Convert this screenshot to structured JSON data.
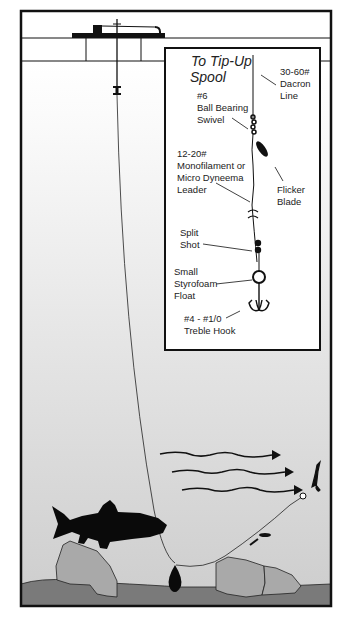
{
  "diagram": {
    "type": "ice-fishing tip-up rig illustration",
    "colors": {
      "frame": "#111111",
      "water_top": "#ffffff",
      "water_bottom": "#cfcfcf",
      "lake_bed": "#7a7a7a",
      "rock": "#a9a9a9",
      "silhouette": "#0a0a0a",
      "inset_bg": "#ffffff"
    },
    "scene": {
      "ice_layer": "Ice with drilled hole",
      "tip_up": "Tip-up on ice",
      "fish": "Trout silhouette",
      "sinker": "Bottom sinker",
      "current_arrows": 3,
      "bait": "Bait minnow on treble hook"
    },
    "inset": {
      "title_line1": "To Tip-Up",
      "title_line2": "Spool",
      "labels": {
        "dacron": [
          "30-60#",
          "Dacron",
          "Line"
        ],
        "swivel": [
          "#6",
          "Ball Bearing",
          "Swivel"
        ],
        "leader": [
          "12-20#",
          "Monofilament or",
          "Micro Dyneema",
          "Leader"
        ],
        "blade": [
          "Flicker",
          "Blade"
        ],
        "split_shot": [
          "Split",
          "Shot"
        ],
        "float": [
          "Small",
          "Styrofoam",
          "Float"
        ],
        "hook": [
          "#4 - #1/0",
          "Treble Hook"
        ]
      }
    }
  }
}
